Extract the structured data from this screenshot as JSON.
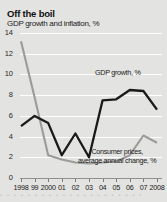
{
  "figure": {
    "title": "Off the boil",
    "subtitle": "GDP growth and inflation, %",
    "background_color": "#e3e3e1",
    "gdp_color": "#1a1a1a",
    "cpi_color": "#9b9b99"
  },
  "annotations": {
    "gdp": "GDP growth, %",
    "cpi_line1": "Consumer prices,",
    "cpi_line2": "average annual change, %"
  },
  "chart_data": {
    "type": "line",
    "title": "Off the boil",
    "subtitle": "GDP growth and inflation, %",
    "xlabel": "",
    "ylabel": "%",
    "ylim": [
      0,
      14
    ],
    "yticks": [
      0,
      2,
      4,
      6,
      8,
      10,
      12,
      14
    ],
    "ytick_labels": [
      "0",
      "2",
      "4",
      "6",
      "8",
      "10",
      "12",
      "14"
    ],
    "x": [
      1998,
      1999,
      2000,
      2001,
      2002,
      2003,
      2004,
      2005,
      2006,
      2007,
      2008
    ],
    "xtick_labels": [
      "1998",
      "99",
      "2000",
      "01",
      "02",
      "03",
      "04",
      "05",
      "06",
      "07",
      "2008"
    ],
    "grid": true,
    "legend": "annotations-in-plot",
    "series": [
      {
        "name": "GDP growth, %",
        "color": "#1a1a1a",
        "values": [
          5.0,
          6.0,
          5.3,
          2.2,
          4.3,
          2.0,
          7.5,
          7.6,
          8.5,
          8.4,
          6.6
        ]
      },
      {
        "name": "Consumer prices, average annual change, %",
        "color": "#9b9b99",
        "values": [
          13.2,
          7.8,
          2.2,
          1.8,
          1.5,
          1.4,
          1.5,
          1.6,
          2.2,
          4.1,
          3.4
        ]
      }
    ]
  },
  "bleed_text": "• • • • • • • • • • • • • • • • • • • • •"
}
